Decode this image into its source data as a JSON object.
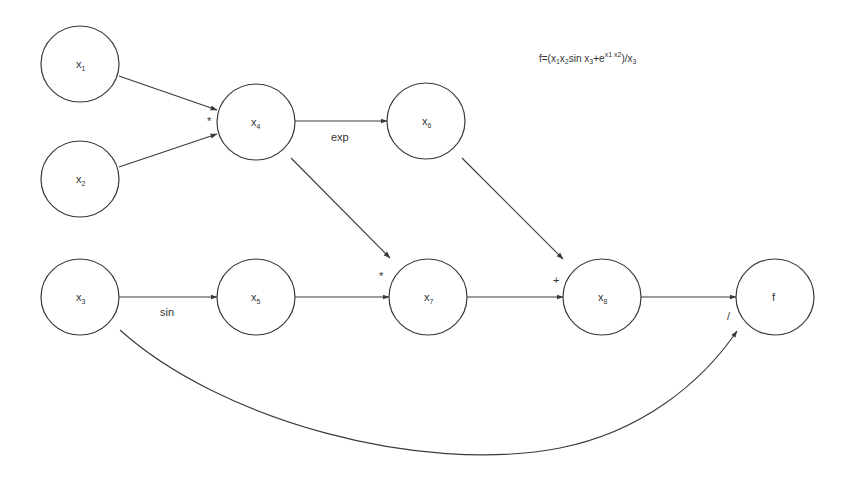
{
  "formula": {
    "text": "f=(x1x2sin x3+e^(x1 x2))/x3",
    "parts": {
      "lhs": "f=(x",
      "s1": "1",
      "a": "x",
      "s2": "2",
      "b": "sin x",
      "s3": "3",
      "c": "+e",
      "sup": "x1 x2",
      "d": ")/x",
      "s4": "3"
    }
  },
  "nodes": [
    {
      "id": "x1",
      "base": "x",
      "sub": "1"
    },
    {
      "id": "x2",
      "base": "x",
      "sub": "2"
    },
    {
      "id": "x4",
      "base": "x",
      "sub": "4"
    },
    {
      "id": "x6",
      "base": "x",
      "sub": "6"
    },
    {
      "id": "x3",
      "base": "x",
      "sub": "3"
    },
    {
      "id": "x5",
      "base": "x",
      "sub": "5"
    },
    {
      "id": "x7",
      "base": "x",
      "sub": "7"
    },
    {
      "id": "x8",
      "base": "x",
      "sub": "8"
    },
    {
      "id": "f",
      "base": "f",
      "sub": ""
    }
  ],
  "edge_labels": {
    "mul1": "*",
    "exp": "exp",
    "sin": "sin",
    "mul2": "*",
    "plus": "+",
    "div": "/"
  }
}
